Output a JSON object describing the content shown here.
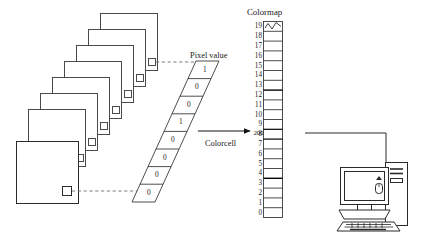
{
  "figure": {
    "type": "bit-plane-to-colormap-diagram",
    "title": "",
    "labels": {
      "pixel_value": "Pixel value",
      "colorcell": "Colorcell",
      "colormap": "Colormap"
    },
    "stroke_color": "#3a3a3a",
    "accent_color": "#000000",
    "background": "#ffffff"
  },
  "bitplanes": {
    "count": 8,
    "note": "stacked square planes, each carrying one small square pixel marker",
    "planes": [
      {
        "index": 0,
        "x": 100.0,
        "y": 13.0,
        "size": 57.0,
        "marker_x": 148.5,
        "marker_y": 58.5,
        "marker_size": 7.0
      },
      {
        "index": 1,
        "x": 88.0,
        "y": 29.0,
        "size": 57.0,
        "marker_x": 136.5,
        "marker_y": 74.5,
        "marker_size": 7.0
      },
      {
        "index": 2,
        "x": 76.0,
        "y": 45.0,
        "size": 57.0,
        "marker_x": 124.5,
        "marker_y": 90.5,
        "marker_size": 7.0
      },
      {
        "index": 3,
        "x": 64.0,
        "y": 61.0,
        "size": 57.0,
        "marker_x": 112.5,
        "marker_y": 106.5,
        "marker_size": 7.0
      },
      {
        "index": 4,
        "x": 52.0,
        "y": 77.0,
        "size": 57.0,
        "marker_x": 100.5,
        "marker_y": 122.5,
        "marker_size": 7.0
      },
      {
        "index": 5,
        "x": 40.0,
        "y": 93.0,
        "size": 57.0,
        "marker_x": 88.5,
        "marker_y": 138.5,
        "marker_size": 7.0
      },
      {
        "index": 6,
        "x": 28.0,
        "y": 109.0,
        "size": 57.0,
        "marker_x": 76.5,
        "marker_y": 154.5,
        "marker_size": 7.0
      },
      {
        "index": 7,
        "x": 16.0,
        "y": 141.0,
        "size": 62.0,
        "marker_x": 62.0,
        "marker_y": 186.0,
        "marker_size": 9.0
      }
    ]
  },
  "pixel_value_column": {
    "label": "Pixel value",
    "orientation": "parallelogram-skewed",
    "bits_top_to_bottom": [
      "1",
      "0",
      "0",
      "1",
      "0",
      "0",
      "0",
      "0"
    ],
    "binary_string": "10010000",
    "decimal_value": "",
    "cells": [
      {
        "row": 0,
        "bit": "1"
      },
      {
        "row": 1,
        "bit": "0"
      },
      {
        "row": 2,
        "bit": "0"
      },
      {
        "row": 3,
        "bit": "1"
      },
      {
        "row": 4,
        "bit": "0"
      },
      {
        "row": 5,
        "bit": "0"
      },
      {
        "row": 6,
        "bit": "0"
      },
      {
        "row": 7,
        "bit": "0"
      }
    ]
  },
  "arrow": {
    "label": "Colorcell",
    "direction": "left-to-right",
    "from": "pixel-value-column",
    "to": "colormap-column"
  },
  "colormap": {
    "label": "Colormap",
    "index_top": "19",
    "index_bottom": "0",
    "indices": [
      "19",
      "18",
      "17",
      "16",
      "15",
      "14",
      "13",
      "12",
      "11",
      "10",
      "9",
      "8",
      "7",
      "6",
      "5",
      "4",
      "3",
      "2",
      "1",
      "0"
    ],
    "highlighted_index": "9",
    "highlighted_value": "200",
    "top_cell_marker": "zigzag-waveform",
    "bold_separator_rows": [
      "13",
      "5"
    ],
    "cells": [
      {
        "index": "19",
        "value": "",
        "marker": "zigzag"
      },
      {
        "index": "18",
        "value": ""
      },
      {
        "index": "17",
        "value": ""
      },
      {
        "index": "16",
        "value": ""
      },
      {
        "index": "15",
        "value": ""
      },
      {
        "index": "14",
        "value": ""
      },
      {
        "index": "13",
        "value": ""
      },
      {
        "index": "12",
        "value": ""
      },
      {
        "index": "11",
        "value": ""
      },
      {
        "index": "10",
        "value": ""
      },
      {
        "index": "9",
        "value": "200"
      },
      {
        "index": "8",
        "value": ""
      },
      {
        "index": "7",
        "value": ""
      },
      {
        "index": "6",
        "value": ""
      },
      {
        "index": "5",
        "value": ""
      },
      {
        "index": "4",
        "value": ""
      },
      {
        "index": "3",
        "value": ""
      },
      {
        "index": "2",
        "value": ""
      },
      {
        "index": "1",
        "value": ""
      },
      {
        "index": "0",
        "value": ""
      }
    ]
  },
  "computer": {
    "name": "desktop-computer",
    "parts": [
      "monitor",
      "screen",
      "stand",
      "keyboard",
      "mouse",
      "tower",
      "tower-vents"
    ],
    "connector": "line-from-colormap-to-tower"
  }
}
